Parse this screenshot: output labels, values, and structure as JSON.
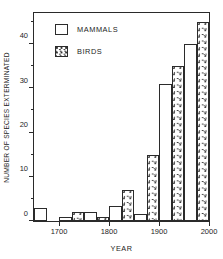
{
  "artifacts": {
    "clipped_header_text": ""
  },
  "chart_data": {
    "type": "bar",
    "title": "",
    "xlabel": "YEAR",
    "ylabel": "NUMBER OF SPECIES EXTERMINATED",
    "xlim": [
      1650,
      2000
    ],
    "ylim": [
      0,
      47
    ],
    "grid": false,
    "bar_interval_years": 50,
    "legend_position": "upper-left-inside",
    "y_ticks_major": [
      0,
      10,
      20,
      30,
      40
    ],
    "y_ticks_minor": [
      5,
      15,
      25,
      35,
      45
    ],
    "x_ticks_major": [
      1700,
      1800,
      1900,
      2000
    ],
    "x_tick_labels": [
      "1700",
      "1800",
      "1900",
      "2000"
    ],
    "categories": [
      "1650",
      "1700",
      "1750",
      "1800",
      "1850",
      "1900",
      "1950"
    ],
    "series": [
      {
        "name": "MAMMALS",
        "fill": "open",
        "values": [
          3,
          1,
          2,
          3.5,
          1.5,
          31,
          40
        ]
      },
      {
        "name": "BIRDS",
        "fill": "stippled",
        "values": [
          0,
          2,
          1,
          7,
          15,
          35,
          45
        ]
      }
    ]
  },
  "legend": {
    "items": [
      {
        "label": "MAMMALS",
        "swatch": "open-square-swatch"
      },
      {
        "label": "BIRDS",
        "swatch": "stippled-square-swatch"
      }
    ]
  }
}
